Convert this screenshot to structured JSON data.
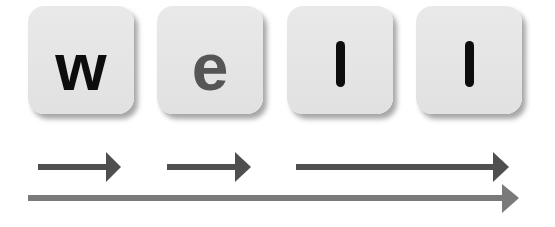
{
  "diagram": {
    "tiles": [
      {
        "letter": "w",
        "color": "#0d0d0d",
        "x": 28,
        "y": 6
      },
      {
        "letter": "e",
        "color": "#555555",
        "x": 157,
        "y": 6
      },
      {
        "letter": "l",
        "color": "#0d0d0d",
        "x": 287,
        "y": 6
      },
      {
        "letter": "l",
        "color": "#0d0d0d",
        "x": 416,
        "y": 6
      }
    ],
    "arrows": [
      {
        "name": "arrow-w",
        "x1": 38,
        "x2": 121,
        "y": 167,
        "color": "#4f4f4f"
      },
      {
        "name": "arrow-e",
        "x1": 167,
        "x2": 251,
        "y": 167,
        "color": "#4f4f4f"
      },
      {
        "name": "arrow-ll",
        "x1": 296,
        "x2": 509,
        "y": 167,
        "color": "#4f4f4f"
      },
      {
        "name": "arrow-word",
        "x1": 28,
        "x2": 519,
        "y": 198,
        "color": "#7a7a7a"
      }
    ],
    "colors": {
      "tile_bg": "#e5e5e5",
      "background": "#ffffff"
    }
  }
}
